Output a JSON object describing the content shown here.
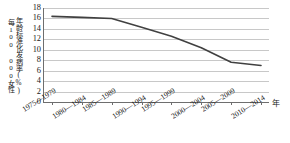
{
  "chart_data": {
    "type": "line",
    "title": "",
    "xlabel": "年",
    "ylabel_line1": "年龄标准化发病率(%)",
    "ylabel_line2": "每100 000女性",
    "categories": [
      "1975—1979",
      "1980—1984",
      "1985—1989",
      "1990—1994",
      "1995—1999",
      "2000—2004",
      "2005—2009",
      "2010—2014"
    ],
    "values": [
      16.4,
      16.2,
      16.0,
      14.3,
      12.6,
      10.4,
      7.6,
      7.0
    ],
    "ylim": [
      0,
      18
    ],
    "yticks": [
      18,
      16,
      14,
      12,
      10,
      8,
      6,
      4,
      2,
      0
    ],
    "ytick_labels": [
      "18",
      "16",
      "14",
      "12",
      "10",
      "8",
      "6",
      "4",
      "2",
      "0"
    ],
    "grid": true,
    "legend": "none",
    "series_color": "#404040",
    "grid_color": "#c8c8c8",
    "axis_color": "#6e6e6e"
  }
}
